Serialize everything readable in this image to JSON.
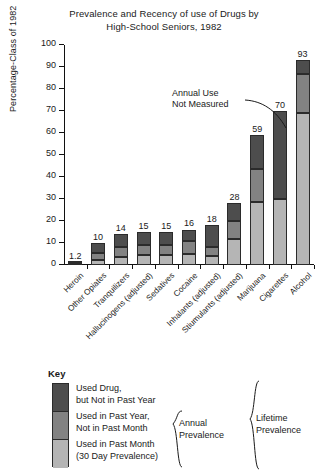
{
  "chart_data": {
    "type": "bar",
    "title": "Prevalence and Recency of use of Drugs by High-School Seniors, 1982",
    "title_line1": "Prevalence and Recency of use of Drugs by",
    "title_line2": "High-School Seniors, 1982",
    "xlabel": "",
    "ylabel": "Percentage-Class of 1982",
    "ylim": [
      0,
      100
    ],
    "ytick_labels": [
      "0",
      "10",
      "20",
      "30",
      "40",
      "50",
      "60",
      "70",
      "80",
      "90",
      "100"
    ],
    "yticks": [
      0,
      10,
      20,
      30,
      40,
      50,
      60,
      70,
      80,
      90,
      100
    ],
    "grid": false,
    "legend_position": "below-plot",
    "stacked": true,
    "categories": [
      "Heroin",
      "Other Opiates",
      "Tranquilizers",
      "Hallucinogens (adjusted)",
      "Sedatives",
      "Cocaine",
      "Inhalants (adjusted)",
      "Stiumulants (adjusted)",
      "Marijuana",
      "Cigarettes",
      "Alcohol"
    ],
    "totals": [
      1.2,
      10,
      14,
      15,
      15,
      16,
      18,
      28,
      59,
      70,
      93
    ],
    "total_labels": [
      "1.2",
      "10",
      "14",
      "15",
      "15",
      "16",
      "18",
      "28",
      "59",
      "70",
      "93"
    ],
    "series": [
      {
        "name": "Used in Past Month (30 Day Prevalence)",
        "short": "past-month",
        "color": "#b5b5b5",
        "values": [
          0.6,
          2.5,
          3.5,
          4.4,
          4.5,
          5.0,
          4.0,
          12.0,
          28.5,
          30.0,
          69.0
        ]
      },
      {
        "name": "Used in Past Year, Not in Past Month",
        "short": "past-year-not-month",
        "color": "#828282",
        "values": [
          0.3,
          3.0,
          4.5,
          4.6,
          4.5,
          6.0,
          4.0,
          8.0,
          15.0,
          0,
          18.0
        ]
      },
      {
        "name": "Used Drug, but Not in Past Year",
        "short": "not-past-year",
        "color": "#4d4d4d",
        "values": [
          0.3,
          4.5,
          6.0,
          6.0,
          6.0,
          5.0,
          10.0,
          8.0,
          15.5,
          40.0,
          6.0
        ]
      }
    ],
    "annotations": [
      {
        "text_line1": "Annual Use",
        "text_line2": "Not Measured",
        "points_to": "Cigarettes"
      }
    ]
  },
  "legend": {
    "title": "Key",
    "items": [
      {
        "label_line1": "Used Drug,",
        "label_line2": "but Not in Past Year",
        "color": "#4d4d4d"
      },
      {
        "label_line1": "Used in Past Year,",
        "label_line2": "Not in Past Month",
        "color": "#828282"
      },
      {
        "label_line1": "Used in Past Month",
        "label_line2": "(30 Day Prevalence)",
        "color": "#b5b5b5"
      }
    ],
    "brace_annual_line1": "Annual",
    "brace_annual_line2": "Prevalence",
    "brace_lifetime_line1": "Lifetime",
    "brace_lifetime_line2": "Prevalence"
  },
  "colors": {
    "axis": "#111111",
    "text": "#1a1a1a",
    "background": "#ffffff"
  }
}
